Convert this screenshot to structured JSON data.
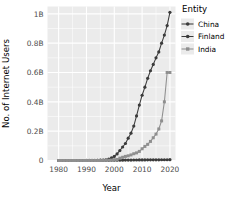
{
  "chart_data": {
    "type": "line",
    "title": "",
    "xlabel": "Year",
    "ylabel": "No. of Internet Users",
    "xlim": [
      1976,
      2022
    ],
    "ylim": [
      0,
      1050000000
    ],
    "grid": true,
    "legend_position": "right",
    "legend_title": "Entity",
    "xticks": [
      1980,
      1990,
      2000,
      2010,
      2020
    ],
    "xtick_labels": [
      "1980",
      "1990",
      "2000",
      "2010",
      "2020"
    ],
    "yticks": [
      0,
      200000000,
      400000000,
      600000000,
      800000000,
      1000000000
    ],
    "ytick_labels": [
      "0",
      "0.2B",
      "0.4B",
      "0.6B",
      "0.8B",
      "1B"
    ],
    "x": [
      1980,
      1981,
      1982,
      1983,
      1984,
      1985,
      1986,
      1987,
      1988,
      1989,
      1990,
      1991,
      1992,
      1993,
      1994,
      1995,
      1996,
      1997,
      1998,
      1999,
      2000,
      2001,
      2002,
      2003,
      2004,
      2005,
      2006,
      2007,
      2008,
      2009,
      2010,
      2011,
      2012,
      2013,
      2014,
      2015,
      2016,
      2017,
      2018,
      2019,
      2020
    ],
    "series": [
      {
        "name": "China",
        "color": "#3b3b3b",
        "marker": "circle",
        "values": [
          0,
          0,
          0,
          0,
          0,
          0,
          0,
          0,
          0,
          0,
          0,
          0,
          0,
          0,
          1000000,
          2000000,
          3000000,
          5000000,
          9000000,
          18000000,
          28000000,
          45000000,
          68000000,
          92000000,
          116000000,
          152000000,
          186000000,
          235000000,
          304000000,
          378000000,
          445000000,
          500000000,
          560000000,
          612000000,
          655000000,
          700000000,
          740000000,
          800000000,
          855000000,
          920000000,
          1010000000
        ]
      },
      {
        "name": "Finland",
        "color": "#3b3b3b",
        "marker": "circle",
        "values": [
          0,
          0,
          0,
          0,
          0,
          0,
          0,
          0,
          0,
          100000,
          200000,
          300000,
          400000,
          500000,
          700000,
          900000,
          1100000,
          1300000,
          1500000,
          1700000,
          1900000,
          2100000,
          2300000,
          2500000,
          2700000,
          2900000,
          3100000,
          3300000,
          3500000,
          3700000,
          3900000,
          4100000,
          4300000,
          4500000,
          4700000,
          4800000,
          4900000,
          5000000,
          5100000,
          5200000,
          5300000
        ]
      },
      {
        "name": "India",
        "color": "#8f8f8f",
        "marker": "square",
        "values": [
          0,
          0,
          0,
          0,
          0,
          0,
          0,
          0,
          0,
          0,
          0,
          0,
          0,
          0,
          0,
          200000,
          500000,
          1000000,
          2000000,
          3000000,
          5000000,
          7000000,
          16000000,
          22000000,
          28000000,
          32000000,
          38000000,
          46000000,
          52000000,
          62000000,
          80000000,
          96000000,
          110000000,
          130000000,
          155000000,
          180000000,
          215000000,
          270000000,
          400000000,
          600000000,
          600000000
        ]
      }
    ]
  },
  "legend": {
    "title": "Entity",
    "items": [
      {
        "label": "China",
        "color": "#3b3b3b"
      },
      {
        "label": "Finland",
        "color": "#3b3b3b"
      },
      {
        "label": "India",
        "color": "#8f8f8f"
      }
    ]
  },
  "axes": {
    "x_title": "Year",
    "y_title": "No. of Internet Users"
  },
  "style": {
    "panel_background": "#ebebeb",
    "gridline_color": "#ffffff",
    "tick_text_color": "#4d4d4d",
    "page_background": "#ffffff"
  }
}
